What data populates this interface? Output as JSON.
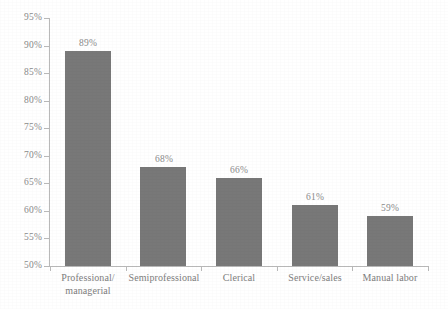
{
  "chart_data": {
    "type": "bar",
    "title": "",
    "subtitle": "",
    "xlabel": "",
    "ylabel": "",
    "categories": [
      "Professional/ managerial",
      "Semiprofessional",
      "Clerical",
      "Service/sales",
      "Manual labor"
    ],
    "category_lines": [
      [
        "Professional/",
        "managerial"
      ],
      [
        "Semiprofessional"
      ],
      [
        "Clerical"
      ],
      [
        "Service/sales"
      ],
      [
        "Manual labor"
      ]
    ],
    "values": [
      89,
      68,
      66,
      61,
      59
    ],
    "value_labels": [
      "89%",
      "68%",
      "66%",
      "61%",
      "59%"
    ],
    "ylim": [
      50,
      95
    ],
    "ytick_values": [
      50,
      55,
      60,
      65,
      70,
      75,
      80,
      85,
      90,
      95
    ],
    "ytick_labels": [
      "50%",
      "55%",
      "60%",
      "65%",
      "70%",
      "75%",
      "80%",
      "85%",
      "90%",
      "95%"
    ],
    "grid": false,
    "legend": false,
    "legend_position": "none",
    "bar_color": "#787878",
    "axis_color": "#b9b9b9",
    "text_color": "#7d7d7d"
  }
}
